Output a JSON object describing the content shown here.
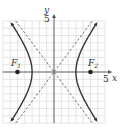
{
  "diagram": {
    "type": "hyperbola",
    "equation": "x^2/9 - y^2/16 = 1",
    "axes": {
      "x_label": "x",
      "y_label": "y",
      "x_tick_label": "5",
      "y_tick_label": "5",
      "range": [
        -7,
        7
      ]
    },
    "foci": [
      {
        "label": "F",
        "sub": "1",
        "x": -5,
        "y": 0
      },
      {
        "label": "F",
        "sub": "2",
        "x": 5,
        "y": 0
      }
    ],
    "vertices": [
      [
        -3,
        0
      ],
      [
        3,
        0
      ]
    ],
    "asymptotes": [
      "y = 4/3 x",
      "y = -4/3 x"
    ],
    "colors": {
      "grid": "#d4d4d4",
      "axis": "#555555",
      "curve": "#333333",
      "asymptote": "#555555",
      "focus": "#222222"
    }
  }
}
